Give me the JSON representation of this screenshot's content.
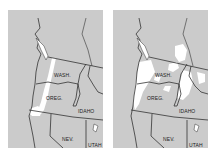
{
  "maps": [
    {
      "id": "left",
      "labels": {
        "wash": "WASH.",
        "oreg": "OREG.",
        "idaho": "IDAHO",
        "nev": "NEV.",
        "utah": "UTAH"
      }
    },
    {
      "id": "right",
      "labels": {
        "wash": "WASH.",
        "oreg": "OREG.",
        "idaho": "IDAHO",
        "nev": "NEV.",
        "utah": "UTAH"
      }
    }
  ],
  "colors": {
    "land": "#cbcbcb",
    "highlight": "#ffffff",
    "border": "#333333"
  }
}
